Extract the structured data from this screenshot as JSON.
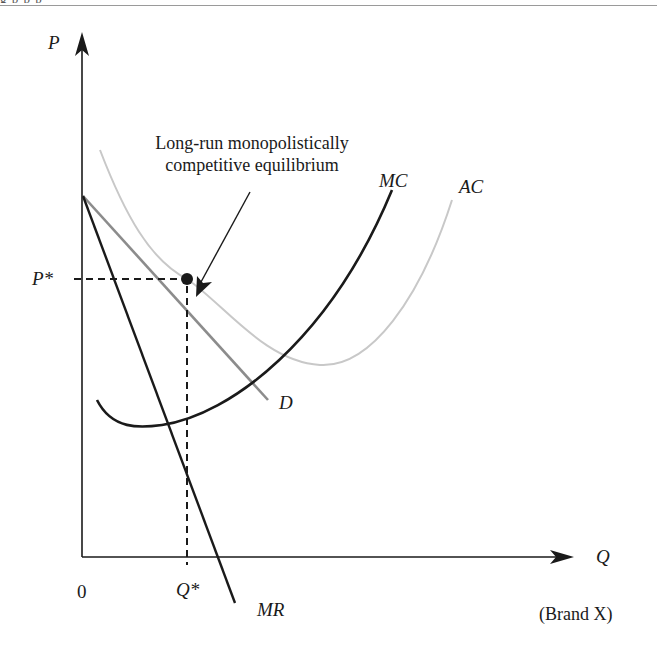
{
  "header": {
    "fragment_text": "g  p                                           p               p"
  },
  "diagram": {
    "title": "Long-run monopolistically competitive equilibrium",
    "annotation": {
      "line1": "Long-run monopolistically",
      "line2": "competitive equilibrium"
    },
    "axes": {
      "y_label": "P",
      "x_label": "Q",
      "origin_label": "0",
      "x_sublabel": "(Brand X)"
    },
    "markers": {
      "price_label": "P*",
      "quantity_label": "Q*"
    },
    "curves": [
      {
        "id": "D",
        "label": "D",
        "color": "#8c8c8c",
        "description": "Demand curve, downward sloping, tangent to AC at equilibrium"
      },
      {
        "id": "MR",
        "label": "MR",
        "color": "#1a1a1a",
        "description": "Marginal revenue, steeper than D, same intercept"
      },
      {
        "id": "MC",
        "label": "MC",
        "color": "#1a1a1a",
        "description": "Marginal cost, U-shaped, crosses MR at Q*"
      },
      {
        "id": "AC",
        "label": "AC",
        "color": "#c8c8c8",
        "description": "Average cost, U-shaped, tangent to D at (Q*, P*)"
      }
    ],
    "equilibrium_point": {
      "x": "Q*",
      "y": "P*"
    },
    "colors": {
      "axis": "#1a1a1a",
      "demand": "#8c8c8c",
      "average_cost": "#c8c8c8",
      "marginal": "#1a1a1a"
    }
  }
}
